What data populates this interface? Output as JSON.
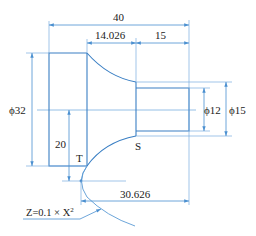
{
  "figure": {
    "type": "engineering-drawing"
  },
  "colors": {
    "outline": "#3a7fc4",
    "dimension": "#5b9bd5",
    "construction": "#8fb8e0",
    "text": "#222222"
  },
  "dimensions": {
    "overall_length": "40",
    "curve_length": "14.026",
    "end_length": "15",
    "large_diameter": "ϕ32",
    "small_diameter_inner": "ϕ12",
    "small_diameter_outer": "ϕ15",
    "vertex_offset": "20",
    "vertex_to_end": "30.626"
  },
  "points": {
    "t_label": "T",
    "s_label": "S"
  },
  "annotations": {
    "equation_prefix": "Z=0.1 × X",
    "equation_exponent": "2"
  }
}
